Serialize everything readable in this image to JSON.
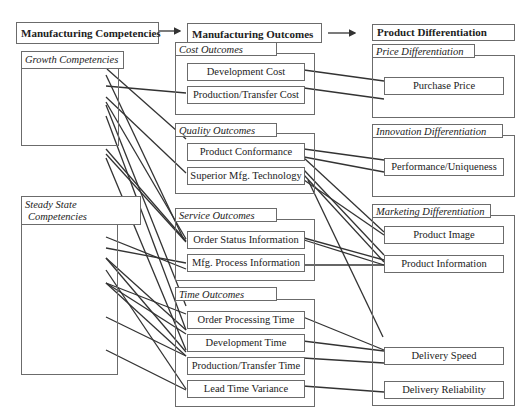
{
  "columns": {
    "competencies": {
      "header": "Manufacturing Competencies"
    },
    "outcomes": {
      "header": "Manufacturing Outcomes"
    },
    "differentiation": {
      "header": "Product Differentiation"
    }
  },
  "competency_groups": [
    {
      "title": "Growth Competencies"
    },
    {
      "title_line1": "Steady State",
      "title_line2": "Competencies"
    }
  ],
  "outcome_groups": [
    {
      "title": "Cost Outcomes",
      "items": [
        "Development Cost",
        "Production/Transfer Cost"
      ]
    },
    {
      "title": "Quality Outcomes",
      "items": [
        "Product Conformance",
        "Superior Mfg. Technology"
      ]
    },
    {
      "title": "Service Outcomes",
      "items": [
        "Order Status Information",
        "Mfg. Process Information"
      ]
    },
    {
      "title": "Time Outcomes",
      "items": [
        "Order Processing Time",
        "Development Time",
        "Production/Transfer Time",
        "Lead Time Variance"
      ]
    }
  ],
  "differentiation_groups": [
    {
      "title": "Price Differentiation",
      "items": [
        "Purchase Price"
      ]
    },
    {
      "title": "Innovation Differentiation",
      "items": [
        "Performance/Uniqueness"
      ]
    },
    {
      "title": "Marketing Differentiation",
      "items": [
        "Product Image",
        "Product Information",
        "Delivery Speed",
        "Delivery Reliability"
      ]
    }
  ],
  "arrows": [
    "competencies-to-outcomes",
    "outcomes-to-differentiation"
  ]
}
